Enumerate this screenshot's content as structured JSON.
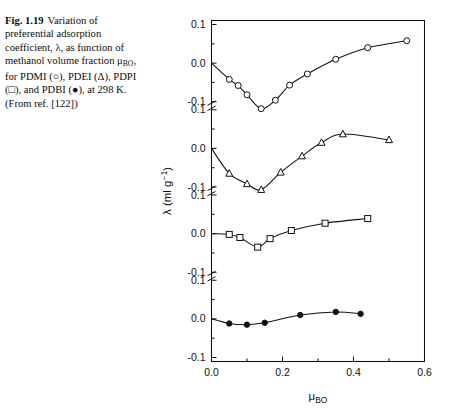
{
  "caption": {
    "fig_number": "Fig. 1.19",
    "line1": "Variation of",
    "line2": "preferential adsorption",
    "line3_a": "coefficient, λ, as function of",
    "line4": "methanol volume fraction",
    "line5_pre": "μ",
    "line5_sub": "BO",
    "line5_post": ", for PDMI (○), PDEI",
    "line6": "(Δ), PDPI (□), and PDBI (●),",
    "line7": "at 298 K. (From ref. [122])"
  },
  "chart_data": {
    "type": "line",
    "title": "",
    "xlabel": "μ_BO",
    "xlabel_base": "μ",
    "xlabel_sub": "BO",
    "ylabel": "λ (ml g⁻¹)",
    "ylabel_base": "λ (ml g",
    "ylabel_sup": "−1",
    "ylabel_tail": ")",
    "xlim": [
      0.0,
      0.6
    ],
    "xticks": [
      0.0,
      0.2,
      0.4,
      0.6
    ],
    "xtick_labels": [
      "0.0",
      "0.2",
      "0.4",
      "0.6"
    ],
    "xminor_ticks": [
      0.1,
      0.3,
      0.5
    ],
    "grid": false,
    "legend_position": "none",
    "axis_broken": true,
    "panel_ylim": [
      -0.1,
      0.1
    ],
    "panel_yticks": [
      0.1,
      0.0,
      -0.1
    ],
    "panel_ytick_labels": [
      "0.1",
      "0.0",
      "-0.1"
    ],
    "temperature": "298 K",
    "series": [
      {
        "name": "PDMI",
        "marker": "open-circle",
        "panel": 1,
        "x": [
          0.0,
          0.05,
          0.075,
          0.1,
          0.14,
          0.18,
          0.22,
          0.27,
          0.35,
          0.44,
          0.55
        ],
        "y": [
          0.0,
          -0.042,
          -0.058,
          -0.082,
          -0.118,
          -0.096,
          -0.057,
          -0.028,
          0.01,
          0.04,
          0.058
        ]
      },
      {
        "name": "PDEI",
        "marker": "open-triangle",
        "panel": 2,
        "x": [
          0.0,
          0.05,
          0.1,
          0.14,
          0.195,
          0.255,
          0.31,
          0.37,
          0.5
        ],
        "y": [
          0.0,
          -0.065,
          -0.092,
          -0.107,
          -0.062,
          -0.02,
          0.015,
          0.037,
          0.022
        ]
      },
      {
        "name": "PDPI",
        "marker": "open-square",
        "panel": 3,
        "x": [
          0.0,
          0.05,
          0.08,
          0.13,
          0.165,
          0.225,
          0.32,
          0.44
        ],
        "y": [
          0.0,
          -0.002,
          -0.01,
          -0.035,
          -0.013,
          0.008,
          0.027,
          0.039
        ]
      },
      {
        "name": "PDBI",
        "marker": "filled-circle",
        "panel": 4,
        "x": [
          0.0,
          0.05,
          0.1,
          0.15,
          0.25,
          0.35,
          0.42
        ],
        "y": [
          0.0,
          -0.012,
          -0.015,
          -0.01,
          0.01,
          0.018,
          0.013
        ]
      }
    ]
  }
}
